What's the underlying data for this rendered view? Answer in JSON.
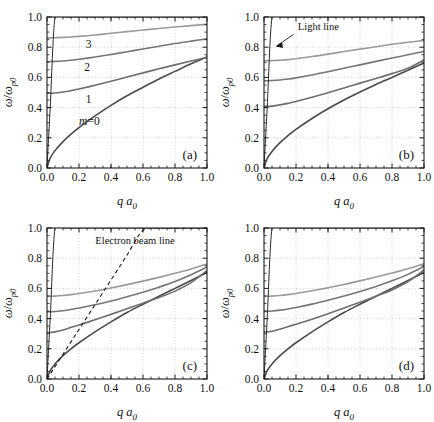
{
  "figure": {
    "panels": [
      "a",
      "b",
      "c",
      "d"
    ],
    "axis": {
      "xlabel": "q a",
      "xlabel_sub": "0",
      "ylabel_num": "ω",
      "ylabel_den": "ω",
      "ylabel_den_sub": "p0",
      "xticks": [
        "0.0",
        "0.2",
        "0.4",
        "0.6",
        "0.8",
        "1.0"
      ],
      "yticks": [
        "0.0",
        "0.2",
        "0.4",
        "0.6",
        "0.8",
        "1.0"
      ],
      "xlim": [
        0.0,
        1.0
      ],
      "ylim": [
        0.0,
        1.0
      ]
    },
    "colors": {
      "m0": "#4a4a4a",
      "m1": "#6e6e6e",
      "m2": "#757575",
      "m3": "#9a9a9a",
      "light_line": "#2a2a2a",
      "beam_line": "#1a1a1a",
      "grid": "#b8b8b8",
      "frame": "#1a1a1a",
      "text": "#111111"
    },
    "panel_a": {
      "tag": "(a)",
      "curve_labels": [
        {
          "text": "3",
          "x": 0.26,
          "y": 0.795
        },
        {
          "text": "2",
          "x": 0.25,
          "y": 0.645
        },
        {
          "text": "1",
          "x": 0.26,
          "y": 0.43
        },
        {
          "text": "m=0",
          "x": 0.265,
          "y": 0.285
        }
      ],
      "has_light_line": true,
      "has_beam_line": false
    },
    "panel_b": {
      "tag": "(b)",
      "annotation": "Light line",
      "has_light_line": true,
      "has_beam_line": false
    },
    "panel_c": {
      "tag": "(c)",
      "annotation": "Electron beam line",
      "has_light_line": true,
      "has_beam_line": true
    },
    "panel_d": {
      "tag": "(d)",
      "has_light_line": true,
      "has_beam_line": false
    }
  },
  "chart_data": [
    {
      "type": "line",
      "panel": "a",
      "title": "(a)",
      "xlabel": "q a0",
      "ylabel": "omega / omega_p0",
      "xlim": [
        0.0,
        1.0
      ],
      "ylim": [
        0.0,
        1.0
      ],
      "grid": true,
      "legend": "inline curve labels",
      "x": [
        0.0,
        0.02,
        0.05,
        0.1,
        0.15,
        0.2,
        0.3,
        0.4,
        0.5,
        0.6,
        0.7,
        0.8,
        0.9,
        1.0
      ],
      "series": [
        {
          "name": "m=0",
          "values": [
            0.0,
            0.065,
            0.115,
            0.175,
            0.225,
            0.268,
            0.345,
            0.415,
            0.478,
            0.535,
            0.59,
            0.64,
            0.69,
            0.735
          ]
        },
        {
          "name": "1",
          "values": [
            0.495,
            0.495,
            0.497,
            0.503,
            0.512,
            0.523,
            0.548,
            0.575,
            0.603,
            0.63,
            0.657,
            0.683,
            0.708,
            0.733
          ]
        },
        {
          "name": "2",
          "values": [
            0.705,
            0.705,
            0.706,
            0.709,
            0.714,
            0.72,
            0.735,
            0.752,
            0.77,
            0.788,
            0.806,
            0.824,
            0.84,
            0.855
          ]
        },
        {
          "name": "3",
          "values": [
            0.862,
            0.862,
            0.863,
            0.865,
            0.868,
            0.872,
            0.881,
            0.892,
            0.903,
            0.914,
            0.924,
            0.934,
            0.943,
            0.951
          ]
        },
        {
          "name": "light line",
          "values": [
            0.0,
            0.4,
            1.0,
            1.0,
            1.0,
            1.0,
            1.0,
            1.0,
            1.0,
            1.0,
            1.0,
            1.0,
            1.0,
            1.0
          ]
        }
      ]
    },
    {
      "type": "line",
      "panel": "b",
      "title": "(b)",
      "xlabel": "q a0",
      "ylabel": "omega / omega_p0",
      "xlim": [
        0.0,
        1.0
      ],
      "ylim": [
        0.0,
        1.0
      ],
      "grid": true,
      "annotations": [
        "Light line"
      ],
      "x": [
        0.0,
        0.02,
        0.05,
        0.1,
        0.15,
        0.2,
        0.3,
        0.4,
        0.5,
        0.6,
        0.7,
        0.8,
        0.9,
        1.0
      ],
      "series": [
        {
          "name": "m=0",
          "values": [
            0.0,
            0.062,
            0.11,
            0.168,
            0.215,
            0.256,
            0.328,
            0.392,
            0.45,
            0.503,
            0.553,
            0.6,
            0.648,
            0.695
          ]
        },
        {
          "name": "1",
          "values": [
            0.408,
            0.408,
            0.41,
            0.418,
            0.428,
            0.44,
            0.468,
            0.498,
            0.53,
            0.562,
            0.593,
            0.625,
            0.66,
            0.715
          ]
        },
        {
          "name": "2",
          "values": [
            0.578,
            0.578,
            0.579,
            0.583,
            0.589,
            0.597,
            0.616,
            0.638,
            0.661,
            0.683,
            0.706,
            0.728,
            0.75,
            0.772
          ]
        },
        {
          "name": "3",
          "values": [
            0.71,
            0.71,
            0.711,
            0.714,
            0.718,
            0.724,
            0.738,
            0.754,
            0.771,
            0.787,
            0.803,
            0.819,
            0.833,
            0.845
          ]
        },
        {
          "name": "light line",
          "values": [
            0.0,
            0.4,
            1.0,
            1.0,
            1.0,
            1.0,
            1.0,
            1.0,
            1.0,
            1.0,
            1.0,
            1.0,
            1.0,
            1.0
          ]
        }
      ]
    },
    {
      "type": "line",
      "panel": "c",
      "title": "(c)",
      "xlabel": "q a0",
      "ylabel": "omega / omega_p0",
      "xlim": [
        0.0,
        1.0
      ],
      "ylim": [
        0.0,
        1.0
      ],
      "grid": true,
      "annotations": [
        "Electron beam line"
      ],
      "x": [
        0.0,
        0.02,
        0.05,
        0.1,
        0.15,
        0.2,
        0.3,
        0.4,
        0.5,
        0.6,
        0.7,
        0.8,
        0.9,
        1.0
      ],
      "series": [
        {
          "name": "m=0",
          "values": [
            0.0,
            0.055,
            0.1,
            0.155,
            0.2,
            0.24,
            0.312,
            0.378,
            0.44,
            0.495,
            0.548,
            0.6,
            0.652,
            0.705
          ]
        },
        {
          "name": "1",
          "values": [
            0.308,
            0.308,
            0.312,
            0.325,
            0.342,
            0.358,
            0.392,
            0.428,
            0.465,
            0.502,
            0.54,
            0.582,
            0.638,
            0.718
          ]
        },
        {
          "name": "2",
          "values": [
            0.445,
            0.445,
            0.447,
            0.452,
            0.46,
            0.47,
            0.492,
            0.517,
            0.545,
            0.575,
            0.608,
            0.645,
            0.69,
            0.742
          ]
        },
        {
          "name": "3",
          "values": [
            0.548,
            0.548,
            0.549,
            0.553,
            0.559,
            0.566,
            0.583,
            0.603,
            0.625,
            0.648,
            0.673,
            0.7,
            0.728,
            0.762
          ]
        },
        {
          "name": "light line",
          "values": [
            0.0,
            0.4,
            1.0,
            1.0,
            1.0,
            1.0,
            1.0,
            1.0,
            1.0,
            1.0,
            1.0,
            1.0,
            1.0,
            1.0
          ]
        },
        {
          "name": "electron beam line",
          "values": [
            0.0,
            0.033,
            0.082,
            0.164,
            0.246,
            0.328,
            0.492,
            0.656,
            0.82,
            0.985,
            1.0,
            1.0,
            1.0,
            1.0
          ]
        }
      ]
    },
    {
      "type": "line",
      "panel": "d",
      "title": "(d)",
      "xlabel": "q a0",
      "ylabel": "omega / omega_p0",
      "xlim": [
        0.0,
        1.0
      ],
      "ylim": [
        0.0,
        1.0
      ],
      "grid": true,
      "x": [
        0.0,
        0.02,
        0.05,
        0.1,
        0.15,
        0.2,
        0.3,
        0.4,
        0.5,
        0.6,
        0.7,
        0.8,
        0.9,
        1.0
      ],
      "series": [
        {
          "name": "m=0",
          "values": [
            0.0,
            0.055,
            0.1,
            0.155,
            0.2,
            0.24,
            0.312,
            0.378,
            0.44,
            0.495,
            0.548,
            0.6,
            0.652,
            0.705
          ]
        },
        {
          "name": "1",
          "values": [
            0.312,
            0.312,
            0.316,
            0.33,
            0.346,
            0.362,
            0.396,
            0.432,
            0.47,
            0.508,
            0.548,
            0.59,
            0.645,
            0.722
          ]
        },
        {
          "name": "2",
          "values": [
            0.448,
            0.448,
            0.45,
            0.456,
            0.464,
            0.474,
            0.496,
            0.522,
            0.55,
            0.58,
            0.613,
            0.65,
            0.693,
            0.745
          ]
        },
        {
          "name": "3",
          "values": [
            0.548,
            0.548,
            0.549,
            0.553,
            0.559,
            0.566,
            0.584,
            0.604,
            0.626,
            0.65,
            0.675,
            0.702,
            0.73,
            0.763
          ]
        },
        {
          "name": "light line",
          "values": [
            0.0,
            0.4,
            1.0,
            1.0,
            1.0,
            1.0,
            1.0,
            1.0,
            1.0,
            1.0,
            1.0,
            1.0,
            1.0,
            1.0
          ]
        }
      ]
    }
  ]
}
